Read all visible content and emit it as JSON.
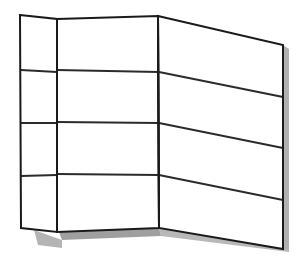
{
  "figure": {
    "canvas": {
      "width": 301,
      "height": 263
    },
    "colors": {
      "background": "#ffffff",
      "face": "#ffffff",
      "outline": "#1a1a1a",
      "slat": "#2b2b2b",
      "shadow": "#a8a8a8",
      "shadow_light": "#c4c4c4"
    },
    "stroke": {
      "outline_width": 2.0,
      "slat_width": 1.9,
      "hinge_width": 2.0
    }
  },
  "geometry": {
    "panels": [
      {
        "name": "left-panel",
        "label": "Left return panel (angled away from viewer)",
        "outline": "20,15 57,19 57,232 21,228",
        "slat_count": 4
      },
      {
        "name": "center-panel",
        "label": "Center panel (front facing)",
        "outline": "57,19 158,16 159,228 57,232",
        "slat_count": 4
      },
      {
        "name": "right-panel",
        "label": "Right panel (receding to the right)",
        "outline": "158,16 283,45 283,249 159,228",
        "slat_count": 4
      }
    ],
    "hinges": [
      {
        "name": "hinge-left-center",
        "points": "57,19 57,232"
      },
      {
        "name": "hinge-center-right",
        "points": "158,16 159,228"
      }
    ],
    "slats": {
      "left_panel": [
        "21,70 57,72",
        "21,123 57,123",
        "21,176 57,175"
      ],
      "center_panel": [
        "57,70 159,72",
        "57,122 159,123",
        "57,174 159,175"
      ],
      "right_panel": [
        "159,72 283,97",
        "159,123 283,148",
        "159,175 283,200"
      ]
    },
    "shadow": {
      "name": "cast-shadow",
      "center_strip": "59,232 159,228 161,236 62,240",
      "left_tab": "34,230 62,240 62,248 38,245",
      "right_strip": "159,228 283,249 289,249 289,252 161,236",
      "right_edge": "283,45 289,49 289,252 283,249"
    }
  }
}
